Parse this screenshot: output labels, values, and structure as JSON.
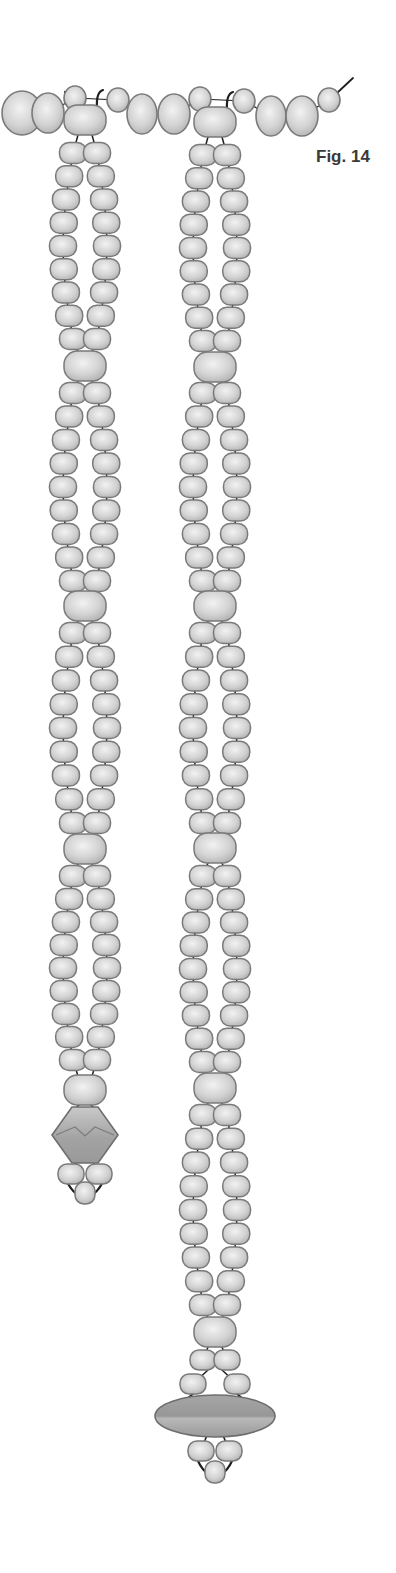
{
  "figure": {
    "label": "Fig. 14"
  },
  "colors": {
    "background": "#ffffff",
    "bead_fill_light": "#efefef",
    "bead_fill_mid": "#cfcfcf",
    "bead_fill_dark": "#b4b4b4",
    "bead_outline": "#7a7a7a",
    "thread": "#1e1e1e",
    "pendant_fill": "#a9a9a9",
    "pendant_dark": "#8c8c8c",
    "label_text": "#3a3a3a"
  },
  "top_strand": {
    "beads": [
      {
        "type": "large",
        "cx": 22,
        "cy": 113,
        "rx": 20,
        "ry": 22
      },
      {
        "type": "large",
        "cx": 48,
        "cy": 113,
        "rx": 16,
        "ry": 20
      },
      {
        "type": "small",
        "cx": 75,
        "cy": 98,
        "rx": 11,
        "ry": 12
      },
      {
        "type": "small",
        "cx": 118,
        "cy": 100,
        "rx": 11,
        "ry": 12
      },
      {
        "type": "large",
        "cx": 142,
        "cy": 114,
        "rx": 15,
        "ry": 20
      },
      {
        "type": "large",
        "cx": 174,
        "cy": 114,
        "rx": 16,
        "ry": 20
      },
      {
        "type": "small",
        "cx": 200,
        "cy": 99,
        "rx": 11,
        "ry": 12
      },
      {
        "type": "small",
        "cx": 244,
        "cy": 101,
        "rx": 11,
        "ry": 12
      },
      {
        "type": "large",
        "cx": 271,
        "cy": 116,
        "rx": 15,
        "ry": 20
      },
      {
        "type": "large",
        "cx": 302,
        "cy": 116,
        "rx": 16,
        "ry": 20
      },
      {
        "type": "small",
        "cx": 329,
        "cy": 100,
        "rx": 11,
        "ry": 12
      }
    ],
    "wire_tail": {
      "x1": 337,
      "y1": 93,
      "x2": 353,
      "y2": 78
    }
  },
  "strands": [
    {
      "name": "left",
      "center_x": 85,
      "top_large_bead_y": 120,
      "segments": [
        {
          "pairs": 9,
          "start_y": 153,
          "end_y": 339,
          "large_bead_y": 366
        },
        {
          "pairs": 9,
          "start_y": 393,
          "end_y": 581,
          "large_bead_y": 606
        },
        {
          "pairs": 9,
          "start_y": 633,
          "end_y": 823,
          "large_bead_y": 849
        },
        {
          "pairs": 9,
          "start_y": 876,
          "end_y": 1060,
          "large_bead_y": 1090
        }
      ],
      "terminal": {
        "pendant": "diamond",
        "pendant_cy": 1135,
        "pendant_w": 66,
        "pendant_h": 56,
        "pair_y": 1174,
        "pair_dx": 14,
        "drop_y": 1193
      }
    },
    {
      "name": "right",
      "center_x": 215,
      "top_large_bead_y": 122,
      "segments": [
        {
          "pairs": 9,
          "start_y": 155,
          "end_y": 341,
          "large_bead_y": 367
        },
        {
          "pairs": 9,
          "start_y": 393,
          "end_y": 581,
          "large_bead_y": 606
        },
        {
          "pairs": 9,
          "start_y": 633,
          "end_y": 823,
          "large_bead_y": 848
        },
        {
          "pairs": 9,
          "start_y": 876,
          "end_y": 1062,
          "large_bead_y": 1088
        },
        {
          "pairs": 9,
          "start_y": 1115,
          "end_y": 1305,
          "large_bead_y": 1332
        }
      ],
      "terminal": {
        "extra_pairs": [
          {
            "y": 1360,
            "dx": 12
          },
          {
            "y": 1384,
            "dx": 22
          }
        ],
        "pendant": "oval",
        "pendant_cy": 1416,
        "pendant_w": 120,
        "pendant_h": 42,
        "pair_y": 1451,
        "pair_dx": 14,
        "drop_y": 1472
      }
    }
  ]
}
